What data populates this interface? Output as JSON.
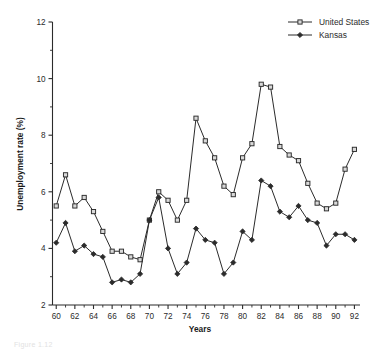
{
  "chart_data": {
    "type": "line",
    "title": "",
    "xlabel": "Years",
    "ylabel": "Unemployment rate (%)",
    "xlim": [
      1959.6,
      1992.6
    ],
    "ylim": [
      2,
      12
    ],
    "ytick_labels": [
      "12",
      "10",
      "8",
      "6",
      "4",
      "2"
    ],
    "ytick_values": [
      12,
      10,
      8,
      6,
      4,
      2
    ],
    "xtick_labels": [
      "60",
      "62",
      "64",
      "66",
      "68",
      "70",
      "72",
      "74",
      "76",
      "78",
      "80",
      "82",
      "84",
      "86",
      "88",
      "90",
      "92"
    ],
    "xtick_values": [
      1960,
      1962,
      1964,
      1966,
      1968,
      1970,
      1972,
      1974,
      1976,
      1978,
      1980,
      1982,
      1984,
      1986,
      1988,
      1990,
      1992
    ],
    "grid": false,
    "legend_position": "top-right",
    "x": [
      1960,
      1961,
      1962,
      1963,
      1964,
      1965,
      1966,
      1967,
      1968,
      1969,
      1970,
      1971,
      1972,
      1973,
      1974,
      1975,
      1976,
      1977,
      1978,
      1979,
      1980,
      1981,
      1982,
      1983,
      1984,
      1985,
      1986,
      1987,
      1988,
      1989,
      1990,
      1991,
      1992
    ],
    "series": [
      {
        "name": "United States",
        "marker": "open-square",
        "values": [
          5.5,
          6.6,
          5.5,
          5.8,
          5.3,
          4.6,
          3.9,
          3.9,
          3.7,
          3.6,
          5.0,
          6.0,
          5.7,
          5.0,
          5.7,
          8.6,
          7.8,
          7.2,
          6.2,
          5.9,
          7.2,
          7.7,
          9.8,
          9.7,
          7.6,
          7.3,
          7.1,
          6.3,
          5.6,
          5.4,
          5.6,
          6.8,
          7.5
        ]
      },
      {
        "name": "Kansas",
        "marker": "filled-diamond",
        "values": [
          4.2,
          4.9,
          3.9,
          4.1,
          3.8,
          3.7,
          2.8,
          2.9,
          2.8,
          3.1,
          5.0,
          5.8,
          4.0,
          3.1,
          3.5,
          4.7,
          4.3,
          4.2,
          3.1,
          3.5,
          4.6,
          4.3,
          6.4,
          6.2,
          5.3,
          5.1,
          5.5,
          5.0,
          4.9,
          4.1,
          4.5,
          4.5,
          4.3
        ]
      }
    ]
  },
  "legend": {
    "items": [
      {
        "label": "United States"
      },
      {
        "label": "Kansas"
      }
    ]
  },
  "caption": {
    "text": "Figure 1.12"
  }
}
